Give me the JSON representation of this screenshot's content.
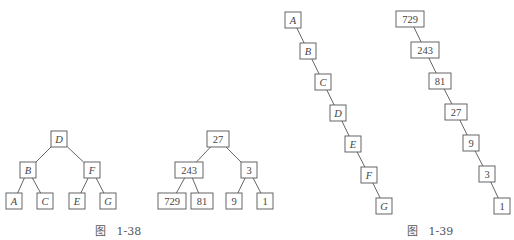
{
  "figures": [
    {
      "id": "fig-1-38",
      "caption": "图   1-38",
      "caption_pos": [
        95,
        222
      ],
      "trees": [
        {
          "name": "balanced-letter-tree",
          "italic": true,
          "box_w": 16,
          "box_h": 16,
          "nodes": [
            {
              "label": "D",
              "x": 59,
              "y": 139
            },
            {
              "label": "B",
              "x": 28,
              "y": 170
            },
            {
              "label": "F",
              "x": 92,
              "y": 170
            },
            {
              "label": "A",
              "x": 14,
              "y": 201
            },
            {
              "label": "C",
              "x": 45,
              "y": 201
            },
            {
              "label": "E",
              "x": 77,
              "y": 201
            },
            {
              "label": "G",
              "x": 108,
              "y": 201
            }
          ],
          "edges": [
            [
              0,
              1
            ],
            [
              0,
              2
            ],
            [
              1,
              3
            ],
            [
              1,
              4
            ],
            [
              2,
              5
            ],
            [
              2,
              6
            ]
          ]
        },
        {
          "name": "balanced-number-tree",
          "italic": false,
          "box_h": 16,
          "nodes": [
            {
              "label": "27",
              "x": 218,
              "y": 139,
              "w": 22
            },
            {
              "label": "243",
              "x": 189,
              "y": 170,
              "w": 28
            },
            {
              "label": "3",
              "x": 249,
              "y": 170,
              "w": 16
            },
            {
              "label": "729",
              "x": 172,
              "y": 201,
              "w": 28
            },
            {
              "label": "81",
              "x": 202,
              "y": 201,
              "w": 22
            },
            {
              "label": "9",
              "x": 234,
              "y": 201,
              "w": 16
            },
            {
              "label": "1",
              "x": 265,
              "y": 201,
              "w": 16
            }
          ],
          "edges": [
            [
              0,
              1
            ],
            [
              0,
              2
            ],
            [
              1,
              3
            ],
            [
              1,
              4
            ],
            [
              2,
              5
            ],
            [
              2,
              6
            ]
          ]
        }
      ]
    },
    {
      "id": "fig-1-39",
      "caption": "图   1-39",
      "caption_pos": [
        407,
        222
      ],
      "trees": [
        {
          "name": "degenerate-letter-chain",
          "italic": true,
          "box_h": 16,
          "nodes": [
            {
              "label": "A",
              "x": 293,
              "y": 20,
              "w": 16
            },
            {
              "label": "B",
              "x": 308,
              "y": 51,
              "w": 16
            },
            {
              "label": "C",
              "x": 323,
              "y": 82,
              "w": 16
            },
            {
              "label": "D",
              "x": 338,
              "y": 113,
              "w": 16
            },
            {
              "label": "E",
              "x": 353,
              "y": 144,
              "w": 16
            },
            {
              "label": "F",
              "x": 369,
              "y": 175,
              "w": 16
            },
            {
              "label": "G",
              "x": 384,
              "y": 206,
              "w": 16
            }
          ],
          "edges": [
            [
              0,
              1
            ],
            [
              1,
              2
            ],
            [
              2,
              3
            ],
            [
              3,
              4
            ],
            [
              4,
              5
            ],
            [
              5,
              6
            ]
          ]
        },
        {
          "name": "degenerate-number-chain",
          "italic": false,
          "box_h": 16,
          "nodes": [
            {
              "label": "729",
              "x": 410,
              "y": 19,
              "w": 28
            },
            {
              "label": "243",
              "x": 425,
              "y": 50,
              "w": 28
            },
            {
              "label": "81",
              "x": 440,
              "y": 81,
              "w": 22
            },
            {
              "label": "27",
              "x": 456,
              "y": 112,
              "w": 22
            },
            {
              "label": "9",
              "x": 471,
              "y": 143,
              "w": 16
            },
            {
              "label": "3",
              "x": 487,
              "y": 174,
              "w": 16
            },
            {
              "label": "1",
              "x": 502,
              "y": 206,
              "w": 16
            }
          ],
          "edges": [
            [
              0,
              1
            ],
            [
              1,
              2
            ],
            [
              2,
              3
            ],
            [
              3,
              4
            ],
            [
              4,
              5
            ],
            [
              5,
              6
            ]
          ]
        }
      ]
    }
  ]
}
